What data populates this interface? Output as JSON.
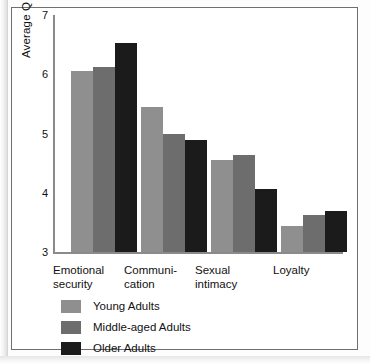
{
  "chart_data": {
    "type": "bar",
    "title": "",
    "subtitle": "",
    "xlabel": "",
    "ylabel": "Average Q sort score",
    "ylim": [
      3,
      7
    ],
    "yticks": [
      3,
      4,
      5,
      6,
      7
    ],
    "ytick_labels": [
      "3",
      "4",
      "5",
      "6",
      "7"
    ],
    "grid": false,
    "legend_position": "below-axes-left",
    "categories": [
      "Emotional\nsecurity",
      "Communi-\ncation",
      "Sexual\nintimacy",
      "Loyalty"
    ],
    "category_labels_flat": [
      "Emotional security",
      "Communi-cation",
      "Sexual intimacy",
      "Loyalty"
    ],
    "series": [
      {
        "name": "Young Adults",
        "color": "#8f8f8f",
        "values": [
          6.05,
          5.45,
          4.55,
          3.44
        ]
      },
      {
        "name": "Middle-aged Adults",
        "color": "#6d6d6d",
        "values": [
          6.12,
          5.0,
          4.63,
          3.62
        ]
      },
      {
        "name": "Older Adults",
        "color": "#1b1b1b",
        "values": [
          6.53,
          4.89,
          4.07,
          3.69
        ]
      }
    ]
  },
  "legend": {
    "items": [
      {
        "label": "Young Adults"
      },
      {
        "label": "Middle-aged Adults"
      },
      {
        "label": "Older Adults"
      }
    ]
  },
  "colors": {
    "series_light_gray": "#8f8f8f",
    "series_medium_gray": "#6d6d6d",
    "series_black": "#1b1b1b",
    "axis": "#8a8a8a",
    "frame": "#6f6f6f",
    "text": "#111111",
    "background": "#ffffff"
  }
}
